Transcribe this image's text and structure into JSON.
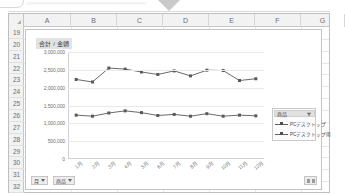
{
  "window": {
    "top_arrow_icon": "arrow-down-icon"
  },
  "spreadsheet": {
    "columns": [
      "A",
      "B",
      "C",
      "D",
      "E",
      "F",
      "G"
    ],
    "rows": [
      "19",
      "20",
      "21",
      "22",
      "23",
      "24",
      "25",
      "26",
      "27",
      "28",
      "29",
      "30",
      "31",
      "32"
    ],
    "select_all_icon": "select-all-corner-icon"
  },
  "chart": {
    "title": "合計 / 金額",
    "slicer": {
      "header_label": "商品",
      "filter_icon": "filter-dropdown-icon"
    },
    "field_buttons": [
      {
        "label": "月",
        "caret_icon": "chevron-down-icon"
      },
      {
        "label": "商品",
        "caret_icon": "chevron-down-icon"
      }
    ],
    "corner_button": {
      "icon": "expand-collapse-icon",
      "label": "表示"
    }
  },
  "chart_data": {
    "type": "line",
    "title": "合計 / 金額",
    "xlabel": "",
    "ylabel": "",
    "ylim": [
      0,
      3000000
    ],
    "ytick_values": [
      0,
      500000,
      1000000,
      1500000,
      2000000,
      2500000,
      3000000
    ],
    "ytick_labels": [
      "0",
      "500,000",
      "1,000,000",
      "1,500,000",
      "2,000,000",
      "2,500,000",
      "3,000,000"
    ],
    "categories": [
      "1月",
      "2月",
      "3月",
      "4月",
      "5月",
      "6月",
      "7月",
      "8月",
      "9月",
      "10月",
      "11月",
      "12月"
    ],
    "grid": true,
    "legend_position": "right",
    "series": [
      {
        "name": "PCデスクトップ",
        "marker": "square",
        "color": "#595959",
        "values": [
          2230000,
          2160000,
          2550000,
          2520000,
          2440000,
          2370000,
          2470000,
          2330000,
          2490000,
          2480000,
          2200000,
          2250000
        ]
      },
      {
        "name": "PCデスクトップ用",
        "marker": "square",
        "color": "#595959",
        "values": [
          1230000,
          1200000,
          1290000,
          1350000,
          1300000,
          1220000,
          1250000,
          1200000,
          1270000,
          1200000,
          1230000,
          1210000
        ]
      }
    ]
  }
}
